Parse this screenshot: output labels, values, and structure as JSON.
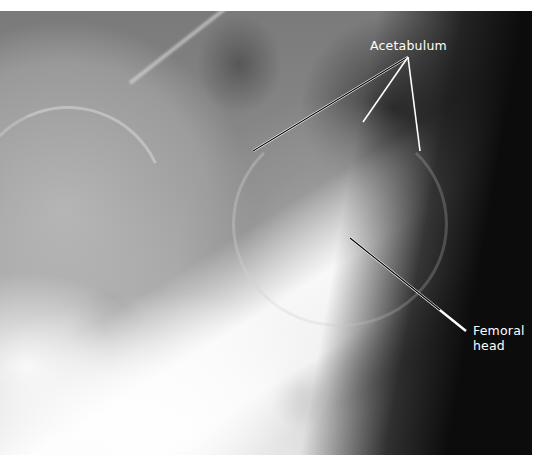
{
  "figure": {
    "type": "radiograph",
    "labels": {
      "acetabulum": "Acetabulum",
      "femoral_head_line1": "Femoral",
      "femoral_head_line2": "head"
    },
    "colors": {
      "label_text": "#ffffff",
      "leader_line_light": "#ffffff",
      "leader_line_dark": "#000000",
      "background": "#ffffff"
    },
    "leader_lines": {
      "acetabulum": [
        {
          "x1": 408,
          "y1": 57,
          "x2": 253,
          "y2": 151
        },
        {
          "x1": 408,
          "y1": 57,
          "x2": 363,
          "y2": 122
        },
        {
          "x1": 408,
          "y1": 57,
          "x2": 420,
          "y2": 151
        }
      ],
      "femoral_head": [
        {
          "x1": 350,
          "y1": 238,
          "x2": 466,
          "y2": 331
        }
      ]
    }
  }
}
